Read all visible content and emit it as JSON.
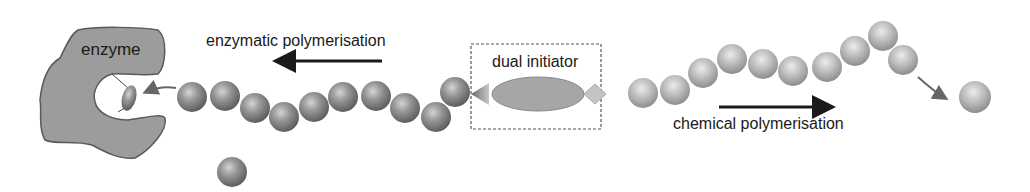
{
  "labels": {
    "enzyme": "enzyme",
    "enzymatic": "enzymatic polymerisation",
    "dual_initiator": "dual initiator",
    "chemical": "chemical polymerisation"
  },
  "colors": {
    "enzyme_fill": "#9a9a9a",
    "enzyme_stroke": "#5a5a5a",
    "sphere_dark": "#7a7a7a",
    "sphere_light": "#b5b5b5",
    "arrow": "#1a1a1a",
    "curved_arrow": "#666666",
    "box_border": "#555555",
    "initiator_fill": "#a8a8a8"
  },
  "left_chain": [
    [
      192,
      97
    ],
    [
      225,
      96
    ],
    [
      255,
      108
    ],
    [
      284,
      117
    ],
    [
      314,
      107
    ],
    [
      343,
      97
    ],
    [
      376,
      96
    ],
    [
      405,
      108
    ],
    [
      436,
      117
    ],
    [
      455,
      92
    ]
  ],
  "right_chain": [
    [
      643,
      93
    ],
    [
      675,
      90
    ],
    [
      703,
      73
    ],
    [
      732,
      59
    ],
    [
      763,
      64
    ],
    [
      793,
      71
    ],
    [
      827,
      67
    ],
    [
      855,
      51
    ],
    [
      883,
      36
    ],
    [
      903,
      60
    ]
  ],
  "loose_spheres": [
    [
      232,
      172
    ],
    [
      975,
      97
    ]
  ]
}
